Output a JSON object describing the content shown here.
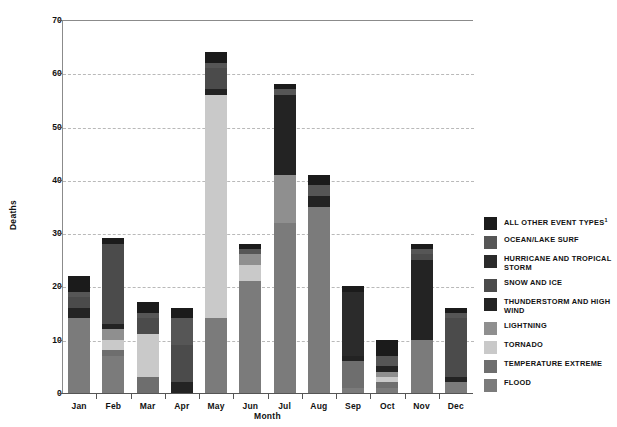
{
  "axes": {
    "ylabel": "Deaths",
    "xlabel": "Month",
    "yticks": [
      "0",
      "10",
      "20",
      "30",
      "40",
      "50",
      "60",
      "70"
    ],
    "xticks": [
      "Jan",
      "Feb",
      "Mar",
      "Apr",
      "May",
      "Jun",
      "Jul",
      "Aug",
      "Sep",
      "Oct",
      "Nov",
      "Dec"
    ]
  },
  "legend": [
    {
      "label": "ALL OTHER EVENT TYPES",
      "sup": "1",
      "color": "#1b1b1b"
    },
    {
      "label": "OCEAN/LAKE SURF",
      "sup": "",
      "color": "#565656"
    },
    {
      "label": "HURRICANE AND TROPICAL STORM",
      "sup": "",
      "color": "#2b2b2b"
    },
    {
      "label": "SNOW AND ICE",
      "sup": "",
      "color": "#4b4b4b"
    },
    {
      "label": "THUNDERSTORM AND HIGH WIND",
      "sup": "",
      "color": "#232323"
    },
    {
      "label": "LIGHTNING",
      "sup": "",
      "color": "#8f8f8f"
    },
    {
      "label": "TORNADO",
      "sup": "",
      "color": "#c9c9c9"
    },
    {
      "label": "TEMPERATURE EXTREME",
      "sup": "",
      "color": "#6e6e6e"
    },
    {
      "label": "FLOOD",
      "sup": "",
      "color": "#7b7b7b"
    }
  ],
  "chart_data": {
    "type": "bar",
    "subtype": "stacked-vertical",
    "title": "",
    "xlabel": "Month",
    "ylabel": "Deaths",
    "ylim": [
      0,
      70
    ],
    "ytick_step": 10,
    "grid": "horizontal-dashed",
    "legend_position": "right",
    "categories": [
      "Jan",
      "Feb",
      "Mar",
      "Apr",
      "May",
      "Jun",
      "Jul",
      "Aug",
      "Sep",
      "Oct",
      "Nov",
      "Dec"
    ],
    "series": [
      {
        "name": "FLOOD",
        "color": "#7b7b7b",
        "values": [
          14,
          7,
          0,
          0,
          14,
          21,
          32,
          35,
          1,
          1,
          10,
          2
        ]
      },
      {
        "name": "TEMPERATURE EXTREME",
        "color": "#6e6e6e",
        "values": [
          0,
          1,
          3,
          0,
          0,
          0,
          0,
          0,
          5,
          1,
          0,
          0
        ]
      },
      {
        "name": "TORNADO",
        "color": "#c9c9c9",
        "values": [
          0,
          2,
          8,
          0,
          42,
          3,
          0,
          0,
          0,
          1,
          0,
          0
        ]
      },
      {
        "name": "LIGHTNING",
        "color": "#8f8f8f",
        "values": [
          0,
          2,
          0,
          0,
          0,
          2,
          9,
          0,
          0,
          1,
          0,
          0
        ]
      },
      {
        "name": "THUNDERSTORM AND HIGH WIND",
        "color": "#232323",
        "values": [
          2,
          1,
          0,
          2,
          1,
          0,
          15,
          2,
          1,
          1,
          15,
          1
        ]
      },
      {
        "name": "SNOW AND ICE",
        "color": "#4b4b4b",
        "values": [
          2,
          15,
          3,
          7,
          4,
          0,
          0,
          0,
          0,
          0,
          1,
          11
        ]
      },
      {
        "name": "HURRICANE AND TROPICAL STORM",
        "color": "#2b2b2b",
        "values": [
          0,
          0,
          0,
          0,
          0,
          0,
          0,
          0,
          12,
          0,
          0,
          0
        ]
      },
      {
        "name": "OCEAN/LAKE SURF",
        "color": "#565656",
        "values": [
          1,
          0,
          1,
          5,
          1,
          1,
          1,
          2,
          0,
          2,
          1,
          1
        ]
      },
      {
        "name": "ALL OTHER EVENT TYPES",
        "color": "#1b1b1b",
        "values": [
          3,
          1,
          2,
          2,
          2,
          1,
          1,
          2,
          1,
          3,
          1,
          1
        ]
      }
    ],
    "totals": [
      22,
      29,
      17,
      16,
      64,
      28,
      58,
      41,
      20,
      10,
      28,
      16
    ]
  }
}
